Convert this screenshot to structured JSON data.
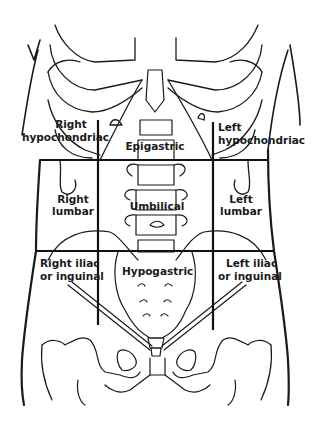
{
  "diagram": {
    "regions": [
      {
        "id": "right-hypochondriac",
        "line1": "Right",
        "line2": "hypochondriac"
      },
      {
        "id": "epigastric",
        "line1": "Epigastric"
      },
      {
        "id": "left-hypochondriac",
        "line1": "Left",
        "line2": "hypochondriac"
      },
      {
        "id": "right-lumbar",
        "line1": "Right",
        "line2": "lumbar"
      },
      {
        "id": "umbilical",
        "line1": "Umbilical"
      },
      {
        "id": "left-lumbar",
        "line1": "Left",
        "line2": "lumbar"
      },
      {
        "id": "right-iliac",
        "line1": "Right iliac",
        "line2": "or inguinal"
      },
      {
        "id": "hypogastric",
        "line1": "Hypogastric"
      },
      {
        "id": "left-iliac",
        "line1": "Left iliac",
        "line2": "or inguinal"
      }
    ],
    "colors": {
      "line": "#111111",
      "background": "#ffffff"
    }
  }
}
